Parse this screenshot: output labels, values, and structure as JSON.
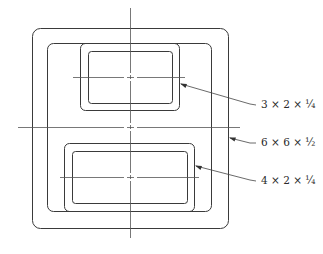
{
  "diagram": {
    "type": "structural tube cross-section assembly",
    "outer_tube": {
      "label": "6 × 6 × ½",
      "name": "outer-tube"
    },
    "top_tube": {
      "label": "3 × 2 × ¼",
      "name": "top-tube"
    },
    "bottom_tube": {
      "label": "4 × 2 × ¼",
      "name": "bottom-tube"
    },
    "colors": {
      "line": "#3a3a3a",
      "background": "#ffffff"
    }
  }
}
